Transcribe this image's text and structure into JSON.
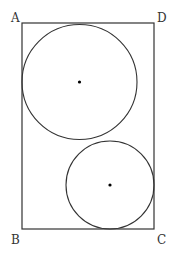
{
  "diagram": {
    "type": "geometry",
    "stroke_color": "#333333",
    "background": "#ffffff",
    "rectangle": {
      "x": 22,
      "y": 23,
      "width": 132,
      "height": 206
    },
    "vertices": [
      {
        "name": "A",
        "x": 11,
        "y": 12
      },
      {
        "name": "D",
        "x": 157,
        "y": 12
      },
      {
        "name": "B",
        "x": 11,
        "y": 234
      },
      {
        "name": "C",
        "x": 157,
        "y": 234
      }
    ],
    "circles": [
      {
        "id": "large",
        "cx": 79.5,
        "cy": 82,
        "r": 57.5,
        "center_marked": true
      },
      {
        "id": "small",
        "cx": 110,
        "cy": 185,
        "r": 44,
        "center_marked": true
      }
    ]
  }
}
